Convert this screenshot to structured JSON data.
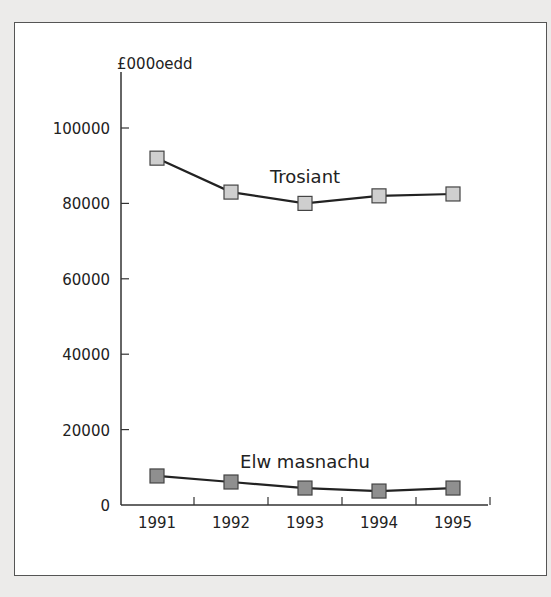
{
  "chart_data": {
    "type": "line",
    "title": "",
    "ylabel": "£000oedd",
    "xlabel": "",
    "categories": [
      "1991",
      "1992",
      "1993",
      "1994",
      "1995"
    ],
    "yticks": [
      "0",
      "20000",
      "40000",
      "60000",
      "80000",
      "100000"
    ],
    "ylim": [
      0,
      115000
    ],
    "grid": false,
    "legend": "inline labels",
    "series": [
      {
        "name": "Trosiant",
        "values": [
          92000,
          83000,
          80000,
          82000,
          82500
        ],
        "marker_color": "#cfcfcf"
      },
      {
        "name": "Elw masnachu",
        "values": [
          7700,
          6100,
          4500,
          3700,
          4500
        ],
        "marker_color": "#8f8f8f"
      }
    ]
  }
}
